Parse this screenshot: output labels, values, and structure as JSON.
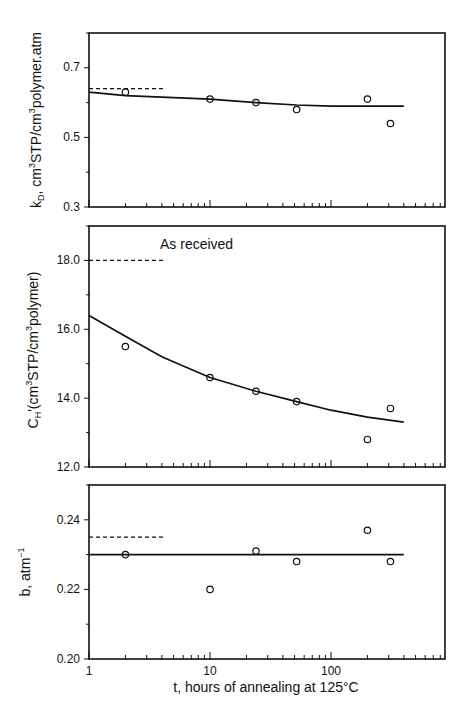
{
  "chart_data": [
    {
      "type": "scatter",
      "panel": "top",
      "title": "",
      "xlabel": "t, hours of annealing at 125°C",
      "ylabel": "kD, cm³STP/cm³polymer.atm",
      "xscale": "log",
      "xlim": [
        1,
        860
      ],
      "ylim": [
        0.3,
        0.8
      ],
      "yticks": [
        0.3,
        0.5,
        0.7
      ],
      "ytick_labels": [
        "0.3",
        "0.5",
        "0.7"
      ],
      "series": [
        {
          "name": "measured",
          "style": "open-circle",
          "x": [
            2,
            10,
            24,
            52,
            200,
            310
          ],
          "y": [
            0.63,
            0.61,
            0.6,
            0.58,
            0.61,
            0.54
          ]
        },
        {
          "name": "fit",
          "style": "solid-line",
          "x": [
            1,
            2,
            10,
            24,
            52,
            100,
            200,
            400
          ],
          "y": [
            0.63,
            0.62,
            0.61,
            0.6,
            0.593,
            0.59,
            0.59,
            0.59
          ]
        },
        {
          "name": "as-received",
          "style": "dashed-line",
          "x": [
            1,
            4.3
          ],
          "y": [
            0.64,
            0.64
          ]
        }
      ]
    },
    {
      "type": "scatter",
      "panel": "middle",
      "xlabel": "t, hours of annealing at 125°C",
      "ylabel": "CH'(cm³STP/cm³polymer)",
      "xscale": "log",
      "xlim": [
        1,
        860
      ],
      "ylim": [
        12.0,
        19.0
      ],
      "yticks": [
        12.0,
        14.0,
        16.0,
        18.0
      ],
      "ytick_labels": [
        "12.0",
        "14.0",
        "16.0",
        "18.0"
      ],
      "annotations": [
        "As received"
      ],
      "series": [
        {
          "name": "measured",
          "style": "open-circle",
          "x": [
            2,
            10,
            24,
            52,
            200,
            310
          ],
          "y": [
            15.5,
            14.6,
            14.2,
            13.9,
            12.8,
            13.7
          ]
        },
        {
          "name": "fit",
          "style": "solid-line",
          "x": [
            1,
            2,
            4,
            10,
            24,
            52,
            100,
            200,
            400
          ],
          "y": [
            16.4,
            15.8,
            15.2,
            14.6,
            14.2,
            13.9,
            13.65,
            13.45,
            13.3
          ]
        },
        {
          "name": "as-received",
          "style": "dashed-line",
          "x": [
            1,
            4.3
          ],
          "y": [
            18.0,
            18.0
          ]
        }
      ]
    },
    {
      "type": "scatter",
      "panel": "bottom",
      "xlabel": "t, hours of annealing at 125°C",
      "ylabel": "b, atm⁻¹",
      "xscale": "log",
      "xlim": [
        1,
        860
      ],
      "ylim": [
        0.2,
        0.25
      ],
      "yticks": [
        0.2,
        0.22,
        0.24
      ],
      "ytick_labels": [
        "0.20",
        "0.22",
        "0.24"
      ],
      "xticks": [
        1,
        10,
        100
      ],
      "xtick_labels": [
        "1",
        "10",
        "100"
      ],
      "series": [
        {
          "name": "measured",
          "style": "open-circle",
          "x": [
            2,
            10,
            24,
            52,
            200,
            310
          ],
          "y": [
            0.23,
            0.22,
            0.231,
            0.228,
            0.237,
            0.228
          ]
        },
        {
          "name": "fit",
          "style": "solid-line",
          "x": [
            1,
            400
          ],
          "y": [
            0.23,
            0.23
          ]
        },
        {
          "name": "as-received",
          "style": "dashed-line",
          "x": [
            1,
            4.3
          ],
          "y": [
            0.235,
            0.235
          ]
        }
      ]
    }
  ],
  "labels": {
    "top_ylabel_main": "k",
    "top_ylabel_sub": "D",
    "top_ylabel_rest_a": ", cm",
    "top_ylabel_sup1": "3",
    "top_ylabel_rest_b": "STP/cm",
    "top_ylabel_sup2": "3",
    "top_ylabel_rest_c": "polymer.atm",
    "mid_ylabel_main": "C",
    "mid_ylabel_sub": "H",
    "mid_ylabel_rest_a": "'(cm",
    "mid_ylabel_sup1": "3",
    "mid_ylabel_rest_b": "STP/cm",
    "mid_ylabel_sup2": "3",
    "mid_ylabel_rest_c": "polymer)",
    "bot_ylabel_a": "b, atm",
    "bot_ylabel_sup": "−1",
    "xlabel": "t, hours of annealing at 125°C",
    "annotation": "As received",
    "top_ticks": [
      "0.7",
      "0.5",
      "0.3"
    ],
    "mid_ticks": [
      "18.0",
      "16.0",
      "14.0",
      "12.0"
    ],
    "bot_ticks": [
      "0.24",
      "0.22",
      "0.20"
    ],
    "x_ticks": [
      "1",
      "10",
      "100"
    ]
  }
}
